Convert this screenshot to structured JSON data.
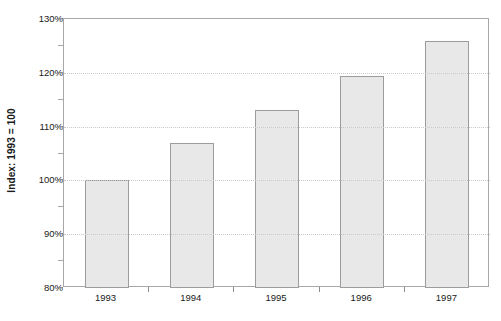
{
  "chart_data": {
    "type": "bar",
    "title": "",
    "subtitle": "",
    "xlabel": "",
    "ylabel": "Index: 1993 = 100",
    "categories": [
      "1993",
      "1994",
      "1995",
      "1996",
      "1997"
    ],
    "values": [
      100,
      107,
      113,
      119.5,
      126
    ],
    "ylim": [
      80,
      130
    ],
    "ytick_values": [
      80,
      90,
      100,
      110,
      120,
      130
    ],
    "ytick_labels": [
      "80%",
      "90%",
      "100%",
      "110%",
      "120%",
      "130%"
    ],
    "yminor_tick_values": [
      85,
      95,
      105,
      115,
      125
    ],
    "gridlines": {
      "y": [
        90,
        100,
        110,
        120
      ],
      "style": "dotted",
      "x": false
    },
    "legend": null,
    "series": [
      {
        "name": "Index",
        "values": [
          100,
          107,
          113,
          119.5,
          126
        ]
      }
    ],
    "colors": {
      "bar_fill": "#e8e8e8",
      "bar_border": "#9c9c9c",
      "grid": "#c9c9c9",
      "axis": "#a8a8a8",
      "text": "#1a1a1a",
      "background": "#ffffff"
    }
  },
  "axis": {
    "y_title": "Index: 1993 = 100"
  }
}
